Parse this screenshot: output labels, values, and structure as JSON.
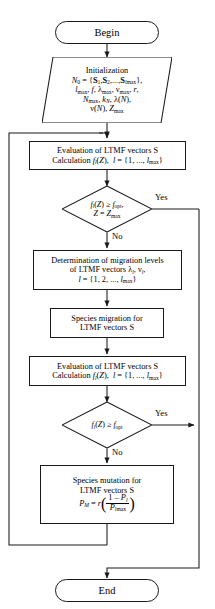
{
  "diagram": {
    "stroke_color": "#1a1a1a",
    "background_color": "#ffffff",
    "nodes": {
      "begin": {
        "type": "terminator",
        "label": "Begin"
      },
      "initialization": {
        "type": "io",
        "line1": "Initialization",
        "line2_prefix": "N",
        "line2_sub": "0",
        "line2_body": " = {S",
        "line2": "N0 = {S1, S2, ..., Slmax},",
        "line3": "lmax, f, λmax, νmax, r,",
        "line4": "Nmax, kN, λ(N),",
        "line5": "ν(N), Zmax"
      },
      "evaluation_1": {
        "type": "process",
        "line1": "Evaluation of LTMF vectors S",
        "line2": "Calculation fl(Z),  l = {1, ..., lmax}"
      },
      "decision_1": {
        "type": "decision",
        "line1": "fl(Z) ≥ fopt,",
        "line2": "Z = Zmax",
        "yes_label": "Yes",
        "no_label": "No"
      },
      "migration_levels": {
        "type": "process",
        "line1": "Determination of migration levels",
        "line2": "of LTMF vectors λl, νl,",
        "line3": "l = {1, 2, ..., lmax}"
      },
      "species_migration": {
        "type": "process",
        "line1": "Species migration for",
        "line2": "LTMF vectors S"
      },
      "evaluation_2": {
        "type": "process",
        "line1": "Evaluation of LTMF vectors S",
        "line2": "Calculation fl(Z),  l = {1, ..., lmax}"
      },
      "decision_2": {
        "type": "decision",
        "line1": "fl(Z) ≥ fopt",
        "yes_label": "Yes",
        "no_label": "No"
      },
      "species_mutation": {
        "type": "process",
        "line1": "Species mutation for",
        "line2": "LTMF vectors S",
        "formula": "PM = r ( (1 - Pl) / Plmax )"
      },
      "end": {
        "type": "terminator",
        "label": "End"
      }
    },
    "symbols": {
      "N": "N",
      "S": "S",
      "f": "f",
      "l": "l",
      "r": "r",
      "Z": "Z",
      "P": "P",
      "lambda": "λ",
      "nu": "ν",
      "ge": "≥",
      "eq": "=",
      "k": "k",
      "max": "max",
      "opt": "opt",
      "zero": "0",
      "one": "1",
      "two": "2",
      "M": "M",
      "ellipsis": "...",
      "brace_open": "{",
      "brace_close": "}",
      "comma": ",",
      "paren_open": "(",
      "paren_close": ")",
      "minus": "–"
    }
  }
}
